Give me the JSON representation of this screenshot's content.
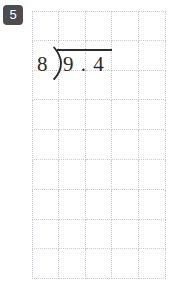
{
  "problem": {
    "number": "5",
    "badge_color": "#4d4d4d",
    "badge_text_color": "#ffffff"
  },
  "division": {
    "divisor": "8",
    "dividend": "9 . 4",
    "quotient": "",
    "bracket_icon": "division-bracket-icon",
    "ink_color": "#2b2b2b",
    "expression": "8)9.4"
  },
  "grid": {
    "columns": 5,
    "rows": 9,
    "cell_width": 26.8,
    "cell_height": 29.8,
    "line_color": "#c9c9cf",
    "line_style": "dotted",
    "background": "#ffffff"
  }
}
